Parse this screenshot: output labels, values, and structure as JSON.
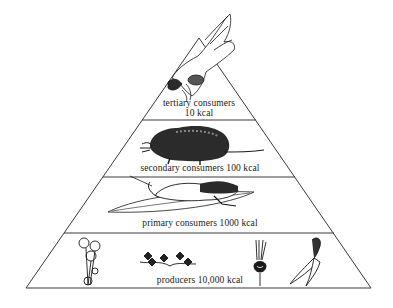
{
  "diagram": {
    "type": "ecological energy pyramid",
    "colors": {
      "line": "#3a3a3a",
      "ink": "#1a1a1a",
      "background": "#ffffff"
    },
    "levels": [
      {
        "id": "tertiary",
        "name": "tertiary consumers",
        "energy": "10 kcal",
        "icon": "hawk-icon"
      },
      {
        "id": "secondary",
        "name": "secondary consumers",
        "energy": "100 kcal",
        "label": "secondary consumers 100 kcal",
        "icon": "shrew-icon"
      },
      {
        "id": "primary",
        "name": "primary consumers",
        "energy": "1000 kcal",
        "label": "primary consumers 1000 kcal",
        "icon": "grasshopper-on-leaf-icon"
      },
      {
        "id": "producers",
        "name": "producers",
        "energy": "10,000 kcal",
        "label": "producers 10,000 kcal",
        "icons": [
          "flower-plant-icon",
          "clover-sprig-icon",
          "radish-icon",
          "carrot-icon"
        ]
      }
    ]
  }
}
